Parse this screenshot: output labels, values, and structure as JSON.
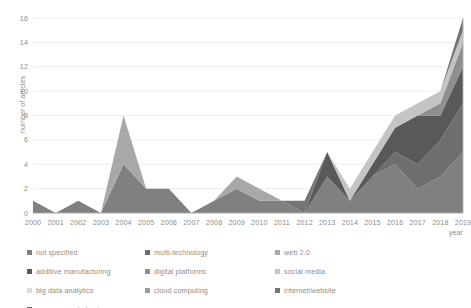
{
  "chart_data": {
    "type": "area",
    "stacked": true,
    "title": "",
    "xlabel": "year",
    "ylabel": "number of articles",
    "categories": [
      2000,
      2001,
      2002,
      2003,
      2004,
      2005,
      2006,
      2007,
      2008,
      2009,
      2010,
      2011,
      2012,
      2013,
      2014,
      2015,
      2016,
      2017,
      2018,
      2019
    ],
    "xtick_labels": [
      "2000",
      "2001",
      "2002",
      "2003",
      "2004",
      "2005",
      "2006",
      "2007",
      "2008",
      "2009",
      "2010",
      "2011",
      "2012",
      "2013",
      "2014",
      "2015",
      "2016",
      "2017",
      "2018",
      "2019"
    ],
    "ylim": [
      0,
      16
    ],
    "ytick_labels": [
      "0",
      "2",
      "4",
      "6",
      "8",
      "10",
      "12",
      "14",
      "16"
    ],
    "yticks": [
      0,
      2,
      4,
      6,
      8,
      10,
      12,
      14,
      16
    ],
    "grid": "horizontal",
    "legend_position": "bottom",
    "legend_columns": 3,
    "series": [
      {
        "name": "not specified",
        "color": "#808080",
        "values": [
          1,
          0,
          1,
          0,
          4,
          2,
          2,
          0,
          1,
          2,
          1,
          1,
          0,
          3,
          1,
          3,
          4,
          2,
          3,
          5
        ]
      },
      {
        "name": "multi-technology",
        "color": "#6e6e6e",
        "values": [
          0,
          0,
          0,
          0,
          0,
          0,
          0,
          0,
          0,
          0,
          0,
          0,
          0,
          0,
          0,
          0,
          1,
          2,
          3,
          4
        ]
      },
      {
        "name": "web 2.0",
        "color": "#a8a8a8",
        "values": [
          0,
          0,
          0,
          0,
          4,
          0,
          0,
          0,
          0,
          1,
          1,
          0,
          0,
          0,
          0,
          0,
          0,
          0,
          0,
          0
        ]
      },
      {
        "name": "additive manufacturing",
        "color": "#595959",
        "values": [
          0,
          0,
          0,
          0,
          0,
          0,
          0,
          0,
          0,
          0,
          0,
          0,
          0,
          2,
          0,
          1,
          2,
          4,
          2,
          3
        ]
      },
      {
        "name": "digital platforms",
        "color": "#8f8f8f",
        "values": [
          0,
          0,
          0,
          0,
          0,
          0,
          0,
          0,
          0,
          0,
          0,
          0,
          0,
          0,
          0,
          0,
          0,
          0,
          1,
          2
        ]
      },
      {
        "name": "social media",
        "color": "#c4c4c4",
        "values": [
          0,
          0,
          0,
          0,
          0,
          0,
          0,
          0,
          0,
          0,
          0,
          0,
          0,
          0,
          1,
          1,
          1,
          1,
          1,
          1
        ]
      },
      {
        "name": "big data analytics",
        "color": "#dcdcdc",
        "values": [
          0,
          0,
          0,
          0,
          0,
          0,
          0,
          0,
          0,
          0,
          0,
          0,
          0,
          0,
          0,
          0,
          0,
          0,
          0,
          0
        ]
      },
      {
        "name": "cloud computing",
        "color": "#9c9c9c",
        "values": [
          0,
          0,
          0,
          0,
          0,
          0,
          0,
          0,
          0,
          0,
          0,
          0,
          0,
          0,
          0,
          0,
          0,
          0,
          0,
          0
        ]
      },
      {
        "name": "internet/website",
        "color": "#747474",
        "values": [
          0,
          0,
          0,
          0,
          0,
          0,
          0,
          0,
          0,
          0,
          0,
          0,
          1,
          0,
          0,
          0,
          0,
          0,
          0,
          1
        ]
      },
      {
        "name": "e-commerce/e-business",
        "color": "#666666",
        "values": [
          0,
          0,
          0,
          0,
          0,
          0,
          0,
          0,
          0,
          0,
          0,
          0,
          0,
          0,
          0,
          0,
          0,
          0,
          0,
          0
        ]
      }
    ],
    "stack_totals": [
      1,
      0,
      1,
      0,
      8,
      2,
      2,
      0,
      1,
      3,
      2,
      1,
      1,
      5,
      2,
      5,
      8,
      9,
      10,
      16
    ],
    "axis_color": "#b0b0b0",
    "grid_color": "#e8e8e8",
    "label_color": "#8d8d8d"
  },
  "legend": {
    "items": [
      {
        "label": "not specified",
        "color": "#808080"
      },
      {
        "label": "multi-technology",
        "color": "#6e6e6e"
      },
      {
        "label": "web 2.0",
        "color": "#a8a8a8"
      },
      {
        "label": "additive manufacturing",
        "color": "#595959"
      },
      {
        "label": "digital platforms",
        "color": "#8f8f8f"
      },
      {
        "label": "social media",
        "color": "#c4c4c4"
      },
      {
        "label": "big data analytics",
        "color": "#dcdcdc"
      },
      {
        "label": "cloud computing",
        "color": "#9c9c9c"
      },
      {
        "label": "internet/website",
        "color": "#747474"
      },
      {
        "label": "e-commerce/e-business",
        "color": "#666666"
      }
    ]
  }
}
